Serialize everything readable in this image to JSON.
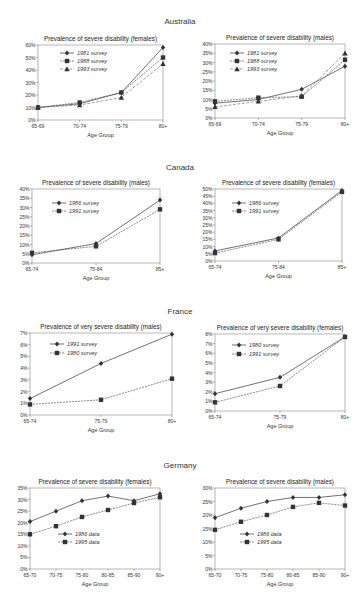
{
  "countries": [
    {
      "name": "Australia"
    },
    {
      "name": "Canada"
    },
    {
      "name": "France"
    },
    {
      "name": "Germany"
    }
  ],
  "chart_data": [
    {
      "id": "aus_f",
      "country": "Australia",
      "type": "line",
      "title": "Prevalence of severe disability (females)",
      "xlabel": "Age Group",
      "ylabel": "",
      "categories": [
        "65-69",
        "70-74",
        "75-79",
        "80+"
      ],
      "ylim": [
        0,
        60
      ],
      "yticks": [
        0,
        10,
        20,
        30,
        40,
        50,
        60
      ],
      "ytick_labels": [
        "0%",
        "10%",
        "20%",
        "30%",
        "40%",
        "50%",
        "60%"
      ],
      "legend_position": "upper-left",
      "series": [
        {
          "name": "1981 survey",
          "marker": "diamond",
          "values": [
            10,
            13,
            22,
            58
          ]
        },
        {
          "name": "1988 survey",
          "marker": "square",
          "values": [
            10,
            14,
            22,
            50
          ]
        },
        {
          "name": "1993 survey",
          "marker": "triangle",
          "values": [
            10,
            12,
            18,
            45
          ]
        }
      ]
    },
    {
      "id": "aus_m",
      "country": "Australia",
      "type": "line",
      "title": "Prevalence of severe disability (males)",
      "xlabel": "Age Group",
      "ylabel": "",
      "categories": [
        "65-69",
        "70-74",
        "75-79",
        "80+"
      ],
      "ylim": [
        0,
        40
      ],
      "yticks": [
        0,
        5,
        10,
        15,
        20,
        25,
        30,
        35,
        40
      ],
      "ytick_labels": [
        "0%",
        "5%",
        "10%",
        "15%",
        "20%",
        "25%",
        "30%",
        "35%",
        "40%"
      ],
      "legend_position": "upper-left",
      "series": [
        {
          "name": "1981 survey",
          "marker": "diamond",
          "values": [
            8,
            10,
            15.5,
            28
          ]
        },
        {
          "name": "1988 survey",
          "marker": "square",
          "values": [
            9,
            11,
            11.5,
            31.5
          ]
        },
        {
          "name": "1993 survey",
          "marker": "triangle",
          "values": [
            6,
            9,
            12,
            35
          ]
        }
      ]
    },
    {
      "id": "can_m",
      "country": "Canada",
      "type": "line",
      "title": "Prevalence of severe disability (males)",
      "xlabel": "Age Group",
      "ylabel": "",
      "categories": [
        "65-74",
        "75-84",
        "85+"
      ],
      "ylim": [
        0,
        40
      ],
      "yticks": [
        0,
        5,
        10,
        15,
        20,
        25,
        30,
        35,
        40
      ],
      "ytick_labels": [
        "0%",
        "5%",
        "10%",
        "15%",
        "20%",
        "25%",
        "30%",
        "35%",
        "40%"
      ],
      "legend_position": "upper-left",
      "series": [
        {
          "name": "1986 survey",
          "marker": "diamond",
          "values": [
            4.5,
            10.5,
            34
          ]
        },
        {
          "name": "1991 survey",
          "marker": "square",
          "values": [
            5.5,
            9,
            29
          ]
        }
      ]
    },
    {
      "id": "can_f",
      "country": "Canada",
      "type": "line",
      "title": "Prevalence of severe disability (females)",
      "xlabel": "Age Group",
      "ylabel": "",
      "categories": [
        "65-74",
        "75-84",
        "85+"
      ],
      "ylim": [
        0,
        50
      ],
      "yticks": [
        0,
        5,
        10,
        15,
        20,
        25,
        30,
        35,
        40,
        45,
        50
      ],
      "ytick_labels": [
        "0%",
        "5%",
        "10%",
        "15%",
        "20%",
        "25%",
        "30%",
        "35%",
        "40%",
        "45%",
        "50%"
      ],
      "legend_position": "upper-left",
      "series": [
        {
          "name": "1986 survey",
          "marker": "diamond",
          "values": [
            7,
            16,
            49
          ]
        },
        {
          "name": "1991 survey",
          "marker": "square",
          "values": [
            5.5,
            15,
            48
          ]
        }
      ]
    },
    {
      "id": "fra_m",
      "country": "France",
      "type": "line",
      "title": "Prevalence of very severe disability (males)",
      "xlabel": "Age Group",
      "ylabel": "",
      "categories": [
        "65-74",
        "75-79",
        "80+"
      ],
      "ylim": [
        0,
        7
      ],
      "yticks": [
        0,
        1,
        2,
        3,
        4,
        5,
        6,
        7
      ],
      "ytick_labels": [
        "0%",
        "1%",
        "2%",
        "3%",
        "4%",
        "5%",
        "6%",
        "7%"
      ],
      "legend_position": "upper-left",
      "series": [
        {
          "name": "1991 survey",
          "marker": "diamond",
          "values": [
            1.4,
            4.4,
            6.9
          ]
        },
        {
          "name": "1980 survey",
          "marker": "square",
          "values": [
            0.9,
            1.3,
            3.1
          ]
        }
      ]
    },
    {
      "id": "fra_f",
      "country": "France",
      "type": "line",
      "title": "Prevalence of very severe disability (females)",
      "xlabel": "Age Group",
      "ylabel": "",
      "categories": [
        "65-74",
        "75-79",
        "80+"
      ],
      "ylim": [
        0,
        8
      ],
      "yticks": [
        0,
        1,
        2,
        3,
        4,
        5,
        6,
        7,
        8
      ],
      "ytick_labels": [
        "0%",
        "1%",
        "2%",
        "3%",
        "4%",
        "5%",
        "6%",
        "7%",
        "8%"
      ],
      "legend_position": "upper-left",
      "series": [
        {
          "name": "1980 survey",
          "marker": "diamond",
          "values": [
            1.8,
            3.5,
            7.7
          ]
        },
        {
          "name": "1991 survey",
          "marker": "square",
          "values": [
            0.9,
            2.6,
            7.7
          ]
        }
      ]
    },
    {
      "id": "ger_f",
      "country": "Germany",
      "type": "line",
      "title": "Prevalence of severe disability (females)",
      "xlabel": "Age Group",
      "ylabel": "",
      "categories": [
        "65-70",
        "70-75",
        "75-80",
        "80-85",
        "85-90",
        "90+"
      ],
      "ylim": [
        0,
        35
      ],
      "yticks": [
        0,
        5,
        10,
        15,
        20,
        25,
        30,
        35
      ],
      "ytick_labels": [
        "0%",
        "5%",
        "10%",
        "15%",
        "20%",
        "25%",
        "30%",
        "35%"
      ],
      "legend_position": "lower-center",
      "series": [
        {
          "name": "1986 data",
          "marker": "diamond",
          "values": [
            20.5,
            25,
            29.5,
            31.5,
            29.5,
            32.5
          ]
        },
        {
          "name": "1995 data",
          "marker": "square",
          "values": [
            15,
            18.5,
            22.5,
            25.5,
            28.5,
            31
          ]
        }
      ]
    },
    {
      "id": "ger_m",
      "country": "Germany",
      "type": "line",
      "title": "Prevalence of severe disability (males)",
      "xlabel": "Age Group",
      "ylabel": "",
      "categories": [
        "65-70",
        "70-75",
        "75-80",
        "80-85",
        "85-90",
        "90+"
      ],
      "ylim": [
        0,
        30
      ],
      "yticks": [
        0,
        5,
        10,
        15,
        20,
        25,
        30
      ],
      "ytick_labels": [
        "0%",
        "5%",
        "10%",
        "15%",
        "20%",
        "25%",
        "30%"
      ],
      "legend_position": "lower-center",
      "series": [
        {
          "name": "1986 data",
          "marker": "diamond",
          "values": [
            19,
            22.5,
            25,
            26.5,
            26.5,
            27.5
          ]
        },
        {
          "name": "1995 data",
          "marker": "square",
          "values": [
            14.5,
            17.5,
            20,
            23,
            24.5,
            23.5
          ]
        }
      ]
    }
  ]
}
